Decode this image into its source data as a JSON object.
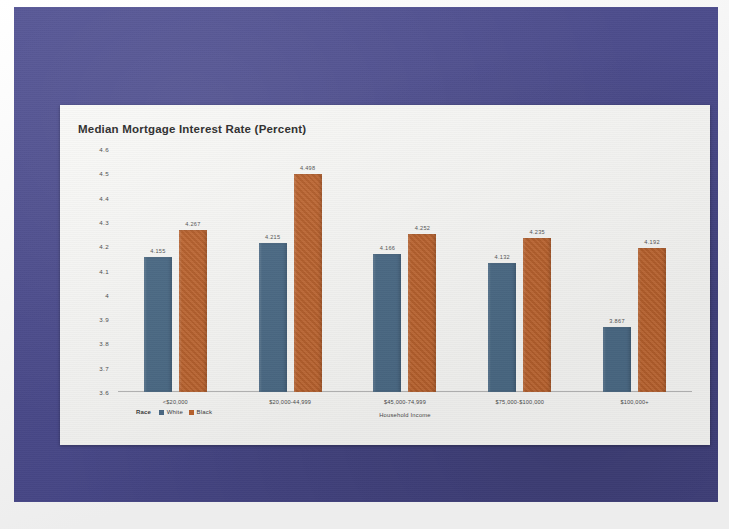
{
  "slide": {
    "background_color": "#4a4a8e",
    "panel_color": "#fdfdfb"
  },
  "chart_data": {
    "type": "bar",
    "title": "Median Mortgage Interest Rate (Percent)",
    "xlabel": "Household Income",
    "ylabel": "",
    "ylim": [
      3.6,
      4.6
    ],
    "ytick_step": 0.1,
    "grid": false,
    "legend_position": "bottom-left",
    "legend_title": "Race",
    "categories": [
      "<$20,000",
      "$20,000-44,999",
      "$45,000-74,999",
      "$75,000-$100,000",
      "$100,000+"
    ],
    "yticks": [
      "4.6",
      "4.5",
      "4.4",
      "4.3",
      "4.2",
      "4.1",
      "4",
      "3.9",
      "3.8",
      "3.7",
      "3.6"
    ],
    "series": [
      {
        "name": "White",
        "color": "#4c6c88",
        "values": [
          4.155,
          4.215,
          4.166,
          4.132,
          3.867
        ],
        "labels": [
          "4.155",
          "4.215",
          "4.166",
          "4.132",
          "3.867"
        ]
      },
      {
        "name": "Black",
        "color": "#c1652e",
        "values": [
          4.267,
          4.498,
          4.252,
          4.235,
          4.192
        ],
        "labels": [
          "4.267",
          "4.498",
          "4.252",
          "4.235",
          "4.192"
        ]
      }
    ]
  }
}
